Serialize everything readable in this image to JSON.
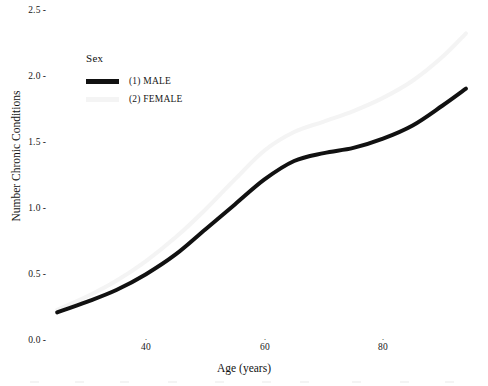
{
  "chart_data": {
    "type": "line",
    "title": "",
    "xlabel": "Age (years)",
    "ylabel": "Number Chronic Conditions",
    "xlim": [
      25,
      95
    ],
    "ylim": [
      0.0,
      2.6
    ],
    "xticks": [
      40,
      60,
      80
    ],
    "xtick_labels": [
      "40",
      "60",
      "80"
    ],
    "yticks": [
      0.0,
      0.5,
      1.0,
      1.5,
      2.0,
      2.5
    ],
    "ytick_labels": [
      "0.0",
      "0.5",
      "1.0",
      "1.5",
      "2.0",
      "2.5"
    ],
    "grid": false,
    "legend_position": "upper-left-inside",
    "legend_title": "Sex",
    "series": [
      {
        "name": "(1) MALE",
        "color": "#111111",
        "linewidth": 4.0,
        "x": [
          25,
          30,
          35,
          40,
          45,
          50,
          55,
          60,
          65,
          70,
          75,
          80,
          85,
          90,
          94
        ],
        "values": [
          0.21,
          0.29,
          0.38,
          0.5,
          0.65,
          0.84,
          1.03,
          1.22,
          1.36,
          1.42,
          1.46,
          1.53,
          1.63,
          1.78,
          1.91
        ]
      },
      {
        "name": "(2) FEMALE",
        "color": "#f4f4f4",
        "linewidth": 4.0,
        "x": [
          25,
          30,
          35,
          40,
          45,
          50,
          55,
          60,
          65,
          70,
          75,
          80,
          85,
          90,
          94
        ],
        "values": [
          0.23,
          0.33,
          0.45,
          0.6,
          0.78,
          0.99,
          1.22,
          1.44,
          1.58,
          1.66,
          1.74,
          1.84,
          1.97,
          2.15,
          2.33
        ]
      }
    ]
  },
  "legend": {
    "title": "Sex",
    "entries": [
      {
        "label": "(1) MALE",
        "color": "#111111"
      },
      {
        "label": "(2) FEMALE",
        "color": "#f4f4f4"
      }
    ]
  },
  "axes": {
    "y_axis_label": "Number Chronic Conditions",
    "x_axis_label": "Age (years)",
    "y_tick_labels": [
      "2.5",
      "2.0",
      "1.5",
      "1.0",
      "0.5",
      "0.0"
    ],
    "x_tick_labels": [
      "40",
      "60",
      "80"
    ],
    "tick_dash": "-",
    "tick_mark_up": "·"
  }
}
